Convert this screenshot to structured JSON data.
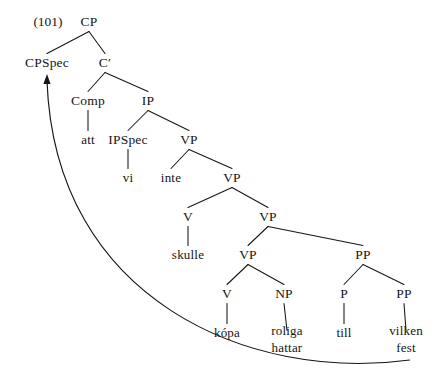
{
  "figure": {
    "example_number": "(101)",
    "ink_color": "#151515",
    "background_color": "#ffffff"
  },
  "tree": {
    "nodes": [
      {
        "id": "CP",
        "label": "CP",
        "x": 89,
        "y": 22,
        "kind": "category"
      },
      {
        "id": "CPSpec",
        "label": "CPSpec",
        "x": 47,
        "y": 63,
        "kind": "category"
      },
      {
        "id": "Cbar",
        "label": "C′",
        "x": 105,
        "y": 63,
        "kind": "category"
      },
      {
        "id": "Comp",
        "label": "Comp",
        "x": 88,
        "y": 101,
        "kind": "category"
      },
      {
        "id": "IP",
        "label": "IP",
        "x": 148,
        "y": 101,
        "kind": "category"
      },
      {
        "id": "att",
        "label": "att",
        "x": 88,
        "y": 140,
        "kind": "leaf"
      },
      {
        "id": "IPSpec",
        "label": "IPSpec",
        "x": 128,
        "y": 140,
        "kind": "category"
      },
      {
        "id": "VP1",
        "label": "VP",
        "x": 189,
        "y": 140,
        "kind": "category"
      },
      {
        "id": "vi",
        "label": "vi",
        "x": 128,
        "y": 178,
        "kind": "leaf"
      },
      {
        "id": "inte",
        "label": "inte",
        "x": 171,
        "y": 178,
        "kind": "leaf"
      },
      {
        "id": "VP2",
        "label": "VP",
        "x": 232,
        "y": 178,
        "kind": "category"
      },
      {
        "id": "V1",
        "label": "V",
        "x": 188,
        "y": 217,
        "kind": "category"
      },
      {
        "id": "VP3",
        "label": "VP",
        "x": 268,
        "y": 217,
        "kind": "category"
      },
      {
        "id": "skulle",
        "label": "skulle",
        "x": 188,
        "y": 255,
        "kind": "leaf"
      },
      {
        "id": "VP4",
        "label": "VP",
        "x": 248,
        "y": 255,
        "kind": "category"
      },
      {
        "id": "PP1",
        "label": "PP",
        "x": 363,
        "y": 255,
        "kind": "category"
      },
      {
        "id": "V2",
        "label": "V",
        "x": 227,
        "y": 294,
        "kind": "category"
      },
      {
        "id": "NP",
        "label": "NP",
        "x": 284,
        "y": 294,
        "kind": "category"
      },
      {
        "id": "P",
        "label": "P",
        "x": 344,
        "y": 294,
        "kind": "category"
      },
      {
        "id": "PP2",
        "label": "PP",
        "x": 404,
        "y": 294,
        "kind": "category"
      },
      {
        "id": "kopa",
        "label": "kópa",
        "x": 227,
        "y": 333,
        "kind": "leaf"
      },
      {
        "id": "roliga",
        "label": "roliga\nhattar",
        "x": 287,
        "y": 340,
        "kind": "leaf"
      },
      {
        "id": "till",
        "label": "till",
        "x": 344,
        "y": 333,
        "kind": "leaf"
      },
      {
        "id": "vilken",
        "label": "vilken\nfest",
        "x": 406,
        "y": 340,
        "kind": "leaf"
      }
    ],
    "edges": [
      {
        "from": "CP",
        "to": "CPSpec"
      },
      {
        "from": "CP",
        "to": "Cbar"
      },
      {
        "from": "Cbar",
        "to": "Comp"
      },
      {
        "from": "Cbar",
        "to": "IP"
      },
      {
        "from": "Comp",
        "to": "att"
      },
      {
        "from": "IP",
        "to": "IPSpec"
      },
      {
        "from": "IP",
        "to": "VP1"
      },
      {
        "from": "IPSpec",
        "to": "vi"
      },
      {
        "from": "VP1",
        "to": "inte"
      },
      {
        "from": "VP1",
        "to": "VP2"
      },
      {
        "from": "VP2",
        "to": "V1"
      },
      {
        "from": "VP2",
        "to": "VP3"
      },
      {
        "from": "V1",
        "to": "skulle"
      },
      {
        "from": "VP3",
        "to": "VP4"
      },
      {
        "from": "VP3",
        "to": "PP1"
      },
      {
        "from": "VP4",
        "to": "V2"
      },
      {
        "from": "VP4",
        "to": "NP"
      },
      {
        "from": "V2",
        "to": "kopa"
      },
      {
        "from": "NP",
        "to": "roliga"
      },
      {
        "from": "PP1",
        "to": "P"
      },
      {
        "from": "PP1",
        "to": "PP2"
      },
      {
        "from": "P",
        "to": "till"
      },
      {
        "from": "PP2",
        "to": "vilken"
      }
    ],
    "movement_arrow": {
      "from_node": "PP2",
      "to_node": "CPSpec",
      "start": {
        "x": 410,
        "y": 360
      },
      "end": {
        "x": 47,
        "y": 74
      },
      "control1": {
        "x": 250,
        "y": 382
      },
      "control2": {
        "x": 55,
        "y": 300
      },
      "arrowhead": "up"
    }
  }
}
